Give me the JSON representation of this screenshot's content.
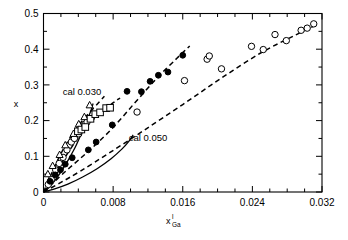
{
  "chart_data": {
    "type": "scatter",
    "title": "",
    "subtitle": "",
    "xlabel": "x",
    "xlabel_sup": "l",
    "xlabel_sub": "Ga",
    "ylabel": "x",
    "xlim": [
      0,
      0.032
    ],
    "ylim": [
      0,
      0.5
    ],
    "x_ticks": [
      0,
      0.008,
      0.016,
      0.024,
      0.032
    ],
    "x_tick_labels": [
      "0",
      "0.008",
      "0.016",
      "0.024",
      "0.032"
    ],
    "x_minor_step": 0.002,
    "y_ticks": [
      0,
      0.1,
      0.2,
      0.3,
      0.4,
      0.5
    ],
    "y_tick_labels": [
      "0",
      "0.1",
      "0.2",
      "0.3",
      "0.4",
      "0.5"
    ],
    "y_minor_step": 0.05,
    "grid": false,
    "legend_position": "none",
    "annotations": [
      {
        "text": "cal 0.030",
        "x": 0.0022,
        "y": 0.272
      },
      {
        "text": "cal 0.050",
        "x": 0.0098,
        "y": 0.142
      }
    ],
    "series": [
      {
        "name": "open-circles-lower",
        "marker": "open-circle",
        "points": [
          [
            0.00055,
            0.021
          ],
          [
            0.0009,
            0.035
          ],
          [
            0.0014,
            0.062
          ],
          [
            0.0018,
            0.08
          ],
          [
            0.00225,
            0.097
          ],
          [
            0.0027,
            0.118
          ],
          [
            0.0032,
            0.14
          ],
          [
            0.00355,
            0.15
          ],
          [
            0.00405,
            0.163
          ],
          [
            0.0044,
            0.178
          ],
          [
            0.00475,
            0.19
          ],
          [
            0.005,
            0.196
          ],
          [
            0.01075,
            0.224
          ],
          [
            0.0162,
            0.312
          ],
          [
            0.0188,
            0.372
          ],
          [
            0.01905,
            0.381
          ],
          [
            0.02045,
            0.345
          ],
          [
            0.0239,
            0.408
          ],
          [
            0.02525,
            0.399
          ],
          [
            0.0266,
            0.441
          ],
          [
            0.0279,
            0.424
          ],
          [
            0.0296,
            0.453
          ],
          [
            0.0303,
            0.459
          ],
          [
            0.03105,
            0.471
          ]
        ]
      },
      {
        "name": "open-triangles",
        "marker": "open-triangle",
        "points": [
          [
            0.0005,
            0.05
          ],
          [
            0.00105,
            0.073
          ],
          [
            0.00185,
            0.104
          ],
          [
            0.0025,
            0.131
          ],
          [
            0.00345,
            0.163
          ],
          [
            0.00405,
            0.19
          ],
          [
            0.0047,
            0.21
          ],
          [
            0.0053,
            0.243
          ]
        ]
      },
      {
        "name": "open-squares",
        "marker": "open-square",
        "points": [
          [
            0.00395,
            0.17
          ],
          [
            0.00435,
            0.175
          ],
          [
            0.0048,
            0.182
          ],
          [
            0.0054,
            0.205
          ],
          [
            0.00595,
            0.218
          ],
          [
            0.0065,
            0.223
          ],
          [
            0.0072,
            0.235
          ],
          [
            0.00765,
            0.236
          ]
        ]
      },
      {
        "name": "filled-circles",
        "marker": "filled-circle",
        "points": [
          [
            0.00075,
            0.03
          ],
          [
            0.00135,
            0.048
          ],
          [
            0.00195,
            0.062
          ],
          [
            0.0025,
            0.078
          ],
          [
            0.0033,
            0.096
          ],
          [
            0.00515,
            0.118
          ],
          [
            0.00605,
            0.14
          ],
          [
            0.0079,
            0.188
          ],
          [
            0.0096,
            0.282
          ],
          [
            0.01125,
            0.281
          ],
          [
            0.01225,
            0.31
          ],
          [
            0.0132,
            0.327
          ],
          [
            0.0143,
            0.336
          ],
          [
            0.016,
            0.383
          ]
        ]
      }
    ],
    "curves": [
      {
        "name": "fit-dashed-upper",
        "style": "dashed",
        "points": [
          [
            0.0,
            0.0
          ],
          [
            0.0006,
            0.034
          ],
          [
            0.0013,
            0.072
          ],
          [
            0.0021,
            0.112
          ],
          [
            0.003,
            0.15
          ],
          [
            0.004,
            0.186
          ],
          [
            0.0052,
            0.22
          ],
          [
            0.0064,
            0.252
          ],
          [
            0.007,
            0.268
          ]
        ]
      },
      {
        "name": "fit-dashed-squares",
        "style": "dashed",
        "points": [
          [
            0.0,
            0.0
          ],
          [
            0.0009,
            0.03
          ],
          [
            0.002,
            0.078
          ],
          [
            0.0033,
            0.128
          ],
          [
            0.0047,
            0.175
          ],
          [
            0.0062,
            0.214
          ],
          [
            0.0079,
            0.248
          ],
          [
            0.0088,
            0.263
          ]
        ]
      },
      {
        "name": "fit-dashed-filled",
        "style": "dashed",
        "points": [
          [
            0.0,
            0.0
          ],
          [
            0.0013,
            0.03
          ],
          [
            0.003,
            0.068
          ],
          [
            0.0052,
            0.115
          ],
          [
            0.0079,
            0.178
          ],
          [
            0.0105,
            0.25
          ],
          [
            0.013,
            0.318
          ],
          [
            0.0153,
            0.374
          ],
          [
            0.0168,
            0.409
          ]
        ]
      },
      {
        "name": "fit-dashed-lower",
        "style": "dashed",
        "points": [
          [
            0.0,
            0.0
          ],
          [
            0.0018,
            0.024
          ],
          [
            0.0042,
            0.058
          ],
          [
            0.0076,
            0.11
          ],
          [
            0.0115,
            0.172
          ],
          [
            0.016,
            0.245
          ],
          [
            0.0205,
            0.32
          ],
          [
            0.025,
            0.39
          ],
          [
            0.029,
            0.44
          ],
          [
            0.0315,
            0.47
          ]
        ]
      },
      {
        "name": "cal-0.030-solid",
        "style": "solid",
        "points": [
          [
            0.0,
            0.0
          ],
          [
            0.0006,
            0.012
          ],
          [
            0.0013,
            0.032
          ],
          [
            0.0021,
            0.06
          ],
          [
            0.0029,
            0.092
          ],
          [
            0.0037,
            0.128
          ],
          [
            0.0044,
            0.166
          ],
          [
            0.005,
            0.2
          ],
          [
            0.00545,
            0.228
          ],
          [
            0.0057,
            0.248
          ]
        ]
      },
      {
        "name": "cal-0.050-solid",
        "style": "solid",
        "points": [
          [
            0.0,
            0.0
          ],
          [
            0.0012,
            0.008
          ],
          [
            0.0028,
            0.022
          ],
          [
            0.0045,
            0.042
          ],
          [
            0.0062,
            0.066
          ],
          [
            0.0078,
            0.094
          ],
          [
            0.009,
            0.12
          ],
          [
            0.0098,
            0.142
          ],
          [
            0.0103,
            0.16
          ]
        ]
      }
    ]
  }
}
